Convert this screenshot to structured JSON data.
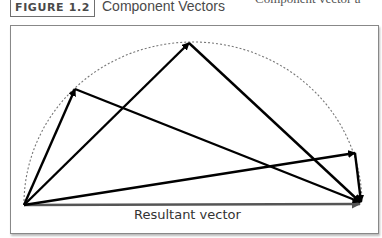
{
  "figure": {
    "label": "FIGURE 1.2",
    "title": "Component Vectors",
    "cutoff_text": "Component vector a"
  },
  "diagram": {
    "resultant_label": "Resultant vector",
    "origin": [
      24,
      205
    ],
    "resultant_end": [
      362,
      203
    ],
    "arc": "semicircle (dotted) through component vector tips",
    "component_pairs": [
      {
        "tip": [
          75,
          89
        ]
      },
      {
        "tip": [
          189,
          43
        ]
      },
      {
        "tip": [
          355,
          153
        ]
      }
    ],
    "colors": {
      "vector": "#000000",
      "arc": "#777777",
      "frame": "#888888"
    }
  }
}
